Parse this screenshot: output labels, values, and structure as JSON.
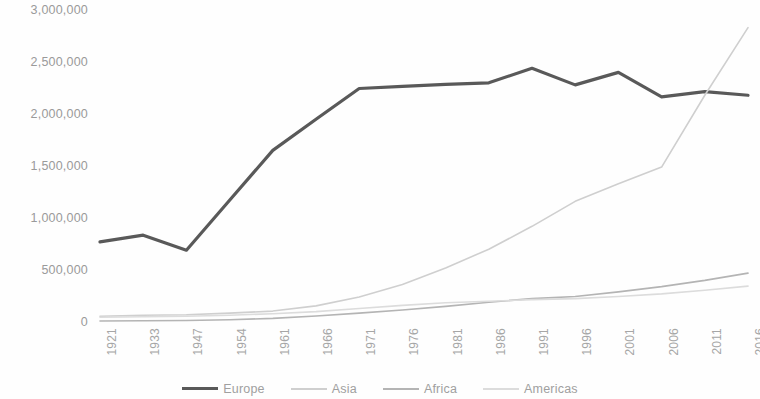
{
  "chart_data": {
    "type": "line",
    "title": "",
    "xlabel": "",
    "ylabel": "",
    "grid": false,
    "legend_position": "bottom",
    "ylim": [
      0,
      3000000
    ],
    "yticks": [
      "0",
      "500,000",
      "1,000,000",
      "1,500,000",
      "2,000,000",
      "2,500,000",
      "3,000,000"
    ],
    "ytick_values": [
      0,
      500000,
      1000000,
      1500000,
      2000000,
      2500000,
      3000000
    ],
    "categories": [
      "1921",
      "1933",
      "1947",
      "1954",
      "1961",
      "1966",
      "1971",
      "1976",
      "1981",
      "1986",
      "1991",
      "1996",
      "2001",
      "2006",
      "2011",
      "2016"
    ],
    "series": [
      {
        "name": "Europe",
        "color": "#595959",
        "width": 3.2,
        "values": [
          770000,
          835000,
          690000,
          1170000,
          1650000,
          1950000,
          2245000,
          2265000,
          2285000,
          2300000,
          2440000,
          2280000,
          2400000,
          2165000,
          2215000,
          2180000
        ]
      },
      {
        "name": "Asia",
        "color": "#cfcfcf",
        "width": 1.6,
        "values": [
          55000,
          65000,
          70000,
          85000,
          105000,
          155000,
          240000,
          360000,
          520000,
          700000,
          920000,
          1160000,
          1330000,
          1490000,
          2180000,
          2830000
        ]
      },
      {
        "name": "Africa",
        "color": "#b4b4b4",
        "width": 1.6,
        "values": [
          10000,
          12000,
          15000,
          22000,
          35000,
          58000,
          85000,
          115000,
          150000,
          190000,
          225000,
          245000,
          290000,
          340000,
          400000,
          470000
        ]
      },
      {
        "name": "Americas",
        "color": "#dcdcdc",
        "width": 1.6,
        "values": [
          45000,
          50000,
          55000,
          65000,
          80000,
          100000,
          130000,
          160000,
          185000,
          200000,
          215000,
          225000,
          245000,
          270000,
          305000,
          345000
        ]
      }
    ]
  },
  "legend": {
    "items": [
      {
        "label": "Europe"
      },
      {
        "label": "Asia"
      },
      {
        "label": "Africa"
      },
      {
        "label": "Americas"
      }
    ]
  }
}
